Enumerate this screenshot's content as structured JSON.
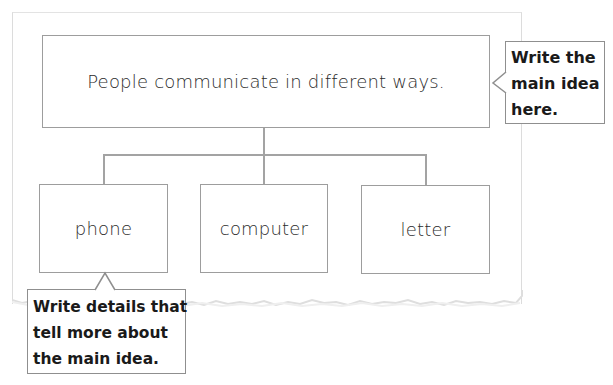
{
  "diagram": {
    "type": "main-idea-and-details organizer",
    "main_idea": {
      "text": "People communicate in different ways."
    },
    "details": [
      {
        "text": "phone"
      },
      {
        "text": "computer"
      },
      {
        "text": "letter"
      }
    ],
    "callouts": {
      "main_idea_hint": {
        "lines": [
          "Write the",
          "main idea",
          "here."
        ]
      },
      "details_hint": {
        "lines": [
          "Write details that",
          "tell more about",
          "the main idea."
        ]
      }
    },
    "colors": {
      "box_border": "#9d9d9d",
      "connector": "#a3a3a3",
      "text": "#2b2b2b",
      "callout_text": "#1a1a1a",
      "paper_edge": "#dcdcdc"
    }
  }
}
